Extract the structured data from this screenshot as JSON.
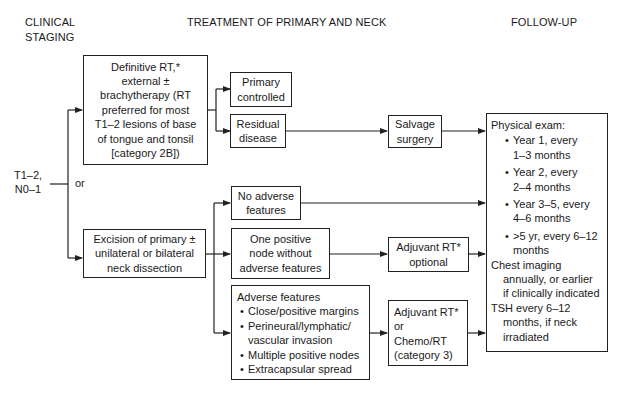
{
  "headers": {
    "clinical_staging_line1": "CLINICAL",
    "clinical_staging_line2": "STAGING",
    "treatment": "TREATMENT OF PRIMARY AND NECK",
    "follow_up": "FOLLOW-UP"
  },
  "staging": {
    "line1": "T1–2,",
    "line2": "N0–1",
    "or_label": "or"
  },
  "definitive_rt": {
    "lines": [
      "Definitive RT,*",
      "external ±",
      "brachytherapy (RT",
      "preferred for most",
      "T1–2 lesions of base",
      "of tongue and tonsil",
      "[category 2B])"
    ]
  },
  "primary_controlled": {
    "lines": [
      "Primary",
      "controlled"
    ]
  },
  "residual_disease": {
    "lines": [
      "Residual",
      "disease"
    ]
  },
  "salvage_surgery": {
    "lines": [
      "Salvage",
      "surgery"
    ]
  },
  "excision": {
    "lines": [
      "Excision of primary ±",
      "unilateral or bilateral",
      "neck dissection"
    ]
  },
  "no_adverse": {
    "lines": [
      "No adverse",
      "features"
    ]
  },
  "one_positive": {
    "lines": [
      "One positive",
      "node without",
      "adverse features"
    ]
  },
  "adjuvant_optional": {
    "lines": [
      "Adjuvant RT*",
      "optional"
    ]
  },
  "adverse_features": {
    "title": "Adverse features",
    "bullets": [
      "Close/positive margins",
      "Perineural/lymphatic/",
      "Multiple positive nodes",
      "Extracapsular spread"
    ],
    "bullet2_cont": "vascular invasion"
  },
  "adjuvant_chemo": {
    "lines": [
      "Adjuvant RT*",
      "or",
      "Chemo/RT",
      "(category 3)"
    ]
  },
  "follow_up": {
    "physical_exam": "Physical exam:",
    "items": [
      {
        "line1": "Year 1, every",
        "line2": "1–3 months"
      },
      {
        "line1": "Year 2, every",
        "line2": "2–4 months"
      },
      {
        "line1": "Year 3–5, every",
        "line2": "4–6 months"
      },
      {
        "line1": ">5 yr, every 6–12",
        "line2": "months"
      }
    ],
    "chest_line1": "Chest imaging",
    "chest_line2": "annually, or earlier",
    "chest_line3": "if clinically indicated",
    "tsh_line1": "TSH every 6–12",
    "tsh_line2": "months, if neck",
    "tsh_line3": "irradiated"
  },
  "colors": {
    "line": "#222222",
    "text": "#1a1a1a",
    "background": "#ffffff"
  }
}
